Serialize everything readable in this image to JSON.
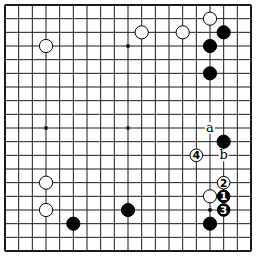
{
  "board": {
    "size": 19,
    "origin_px": 5,
    "spacing_px": 13.667,
    "line_color": "#1a1a1a",
    "background": "#ffffff",
    "star_points": [
      [
        3,
        3
      ],
      [
        9,
        3
      ],
      [
        15,
        3
      ],
      [
        3,
        9
      ],
      [
        9,
        9
      ],
      [
        15,
        9
      ],
      [
        3,
        15
      ],
      [
        9,
        15
      ],
      [
        15,
        15
      ]
    ]
  },
  "stones": [
    {
      "color": "white",
      "col": 3,
      "row": 3
    },
    {
      "color": "white",
      "col": 10,
      "row": 2
    },
    {
      "color": "white",
      "col": 13,
      "row": 2
    },
    {
      "color": "white",
      "col": 15,
      "row": 1
    },
    {
      "color": "black",
      "col": 16,
      "row": 2
    },
    {
      "color": "black",
      "col": 15,
      "row": 3
    },
    {
      "color": "black",
      "col": 15,
      "row": 5
    },
    {
      "color": "black",
      "col": 16,
      "row": 10
    },
    {
      "color": "white",
      "col": 15,
      "row": 14
    },
    {
      "color": "white",
      "col": 3,
      "row": 13
    },
    {
      "color": "white",
      "col": 3,
      "row": 15
    },
    {
      "color": "black",
      "col": 9,
      "row": 15
    },
    {
      "color": "black",
      "col": 5,
      "row": 16
    },
    {
      "color": "black",
      "col": 15,
      "row": 16
    },
    {
      "color": "black",
      "col": 16,
      "row": 14,
      "label": "1"
    },
    {
      "color": "white",
      "col": 16,
      "row": 13,
      "label": "2"
    },
    {
      "color": "black",
      "col": 16,
      "row": 15,
      "label": "3"
    },
    {
      "color": "white",
      "col": 14,
      "row": 11,
      "label": "4"
    }
  ],
  "markers": [
    {
      "text": "a",
      "col": 15,
      "row": 9
    },
    {
      "text": "b",
      "col": 16,
      "row": 11
    }
  ]
}
